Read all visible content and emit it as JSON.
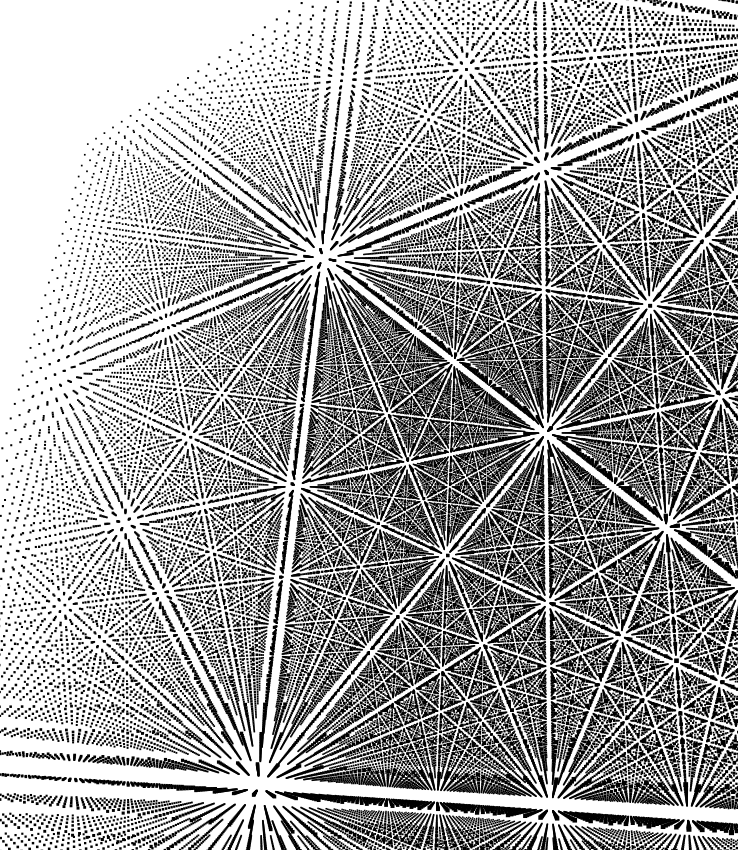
{
  "image": {
    "description": "Perspective view of a 3D cubic point lattice; white lines radiate through aligned rows of dots and vanish at several points",
    "width": 738,
    "height": 850,
    "background": "#ffffff",
    "dot_color": "#000000"
  },
  "lattice": {
    "n": 46,
    "spacing": 1.0,
    "dot_size": 1.6,
    "rotation_deg": {
      "x": -24,
      "y": 38,
      "z": 4
    },
    "camera_distance": 62,
    "focal": 820,
    "center": {
      "x": 395,
      "y": 430
    },
    "offset": {
      "x": 10,
      "y": 6,
      "z": 0
    }
  },
  "visible_features": {
    "vanishing_points": [
      {
        "x": 510,
        "y": 592
      },
      {
        "x": 308,
        "y": 335
      },
      {
        "x": 383,
        "y": 155
      },
      {
        "x": 515,
        "y": 245
      },
      {
        "x": 650,
        "y": 185
      },
      {
        "x": 738,
        "y": 420
      }
    ],
    "silhouette_corners": [
      {
        "x": 35,
        "y": 100
      },
      {
        "x": 372,
        "y": 40
      },
      {
        "x": 738,
        "y": 50
      },
      {
        "x": 738,
        "y": 850
      },
      {
        "x": 560,
        "y": 820
      },
      {
        "x": 80,
        "y": 700
      }
    ]
  }
}
